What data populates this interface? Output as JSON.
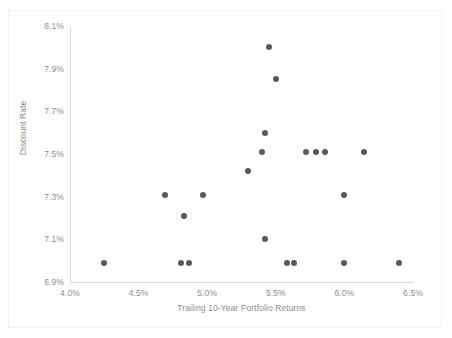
{
  "chart_data": {
    "type": "scatter",
    "title": "",
    "xlabel": "Trailing 10-Year Portfolio Returns",
    "ylabel": "Discount Rate",
    "xlim": [
      4.0,
      6.5
    ],
    "ylim": [
      6.9,
      8.1
    ],
    "xtick_labels": [
      "4.0%",
      "4.5%",
      "5.0%",
      "5.5%",
      "6.0%",
      "6.5%"
    ],
    "xticks": [
      4.0,
      4.5,
      5.0,
      5.5,
      6.0,
      6.5
    ],
    "ytick_labels": [
      "6.9%",
      "7.1%",
      "7.3%",
      "7.5%",
      "7.7%",
      "7.9%",
      "8.1%"
    ],
    "yticks": [
      6.9,
      7.1,
      7.3,
      7.5,
      7.7,
      7.9,
      8.1
    ],
    "grid": false,
    "legend": false,
    "marker_color": "#595959",
    "axis_color": "#d9d9d9",
    "text_color": "#8c8c8c",
    "series": [
      {
        "name": "Portfolio observations",
        "points": [
          {
            "x": 5.45,
            "y": 8.0
          },
          {
            "x": 5.5,
            "y": 7.85
          },
          {
            "x": 5.42,
            "y": 7.6
          },
          {
            "x": 5.4,
            "y": 7.51
          },
          {
            "x": 5.72,
            "y": 7.51
          },
          {
            "x": 5.79,
            "y": 7.51
          },
          {
            "x": 5.86,
            "y": 7.51
          },
          {
            "x": 6.14,
            "y": 7.51
          },
          {
            "x": 5.3,
            "y": 7.42
          },
          {
            "x": 4.69,
            "y": 7.31
          },
          {
            "x": 4.97,
            "y": 7.31
          },
          {
            "x": 6.0,
            "y": 7.31
          },
          {
            "x": 4.83,
            "y": 7.21
          },
          {
            "x": 5.42,
            "y": 7.1
          },
          {
            "x": 4.25,
            "y": 6.99
          },
          {
            "x": 4.81,
            "y": 6.99
          },
          {
            "x": 4.87,
            "y": 6.99
          },
          {
            "x": 5.58,
            "y": 6.99
          },
          {
            "x": 5.63,
            "y": 6.99
          },
          {
            "x": 6.0,
            "y": 6.99
          },
          {
            "x": 6.4,
            "y": 6.99
          }
        ]
      }
    ]
  }
}
